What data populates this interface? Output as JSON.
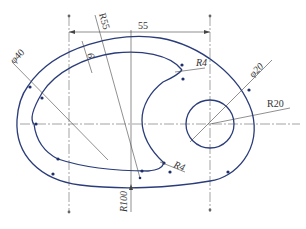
{
  "drawing": {
    "title": "Cam plate with curved slot (engineering drawing)",
    "colors": {
      "outline": "#2a3c7a",
      "dimension": "#444444",
      "centerline": "#666666",
      "text": "#333333"
    },
    "dimensions": {
      "width_55": "55",
      "r55": "R55",
      "slot_width_6": "6",
      "phi40": "φ40",
      "r4_top": "R4",
      "phi20": "φ20",
      "r20": "R20",
      "r4_bottom": "R4",
      "r100": "R100"
    }
  }
}
